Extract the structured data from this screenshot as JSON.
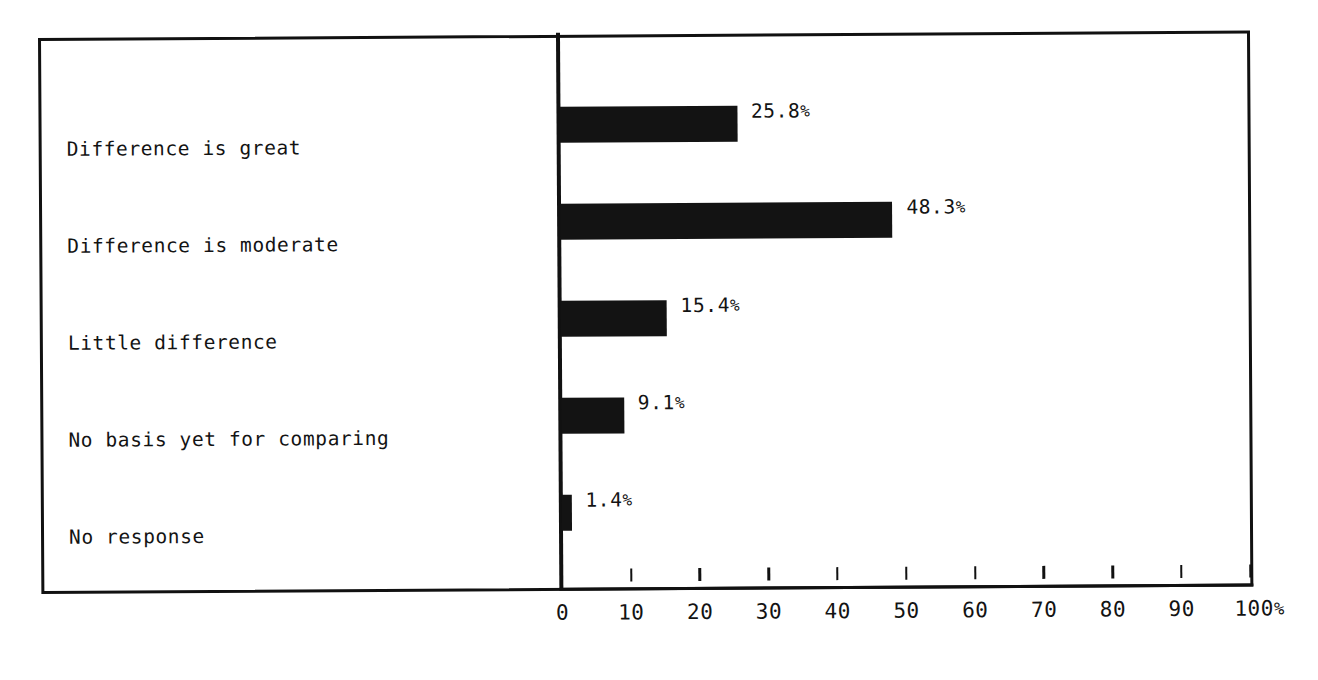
{
  "chart_data": {
    "type": "bar",
    "orientation": "horizontal",
    "title": "",
    "subtitle": "",
    "xlabel": "",
    "ylabel": "",
    "categories": [
      "Difference is great",
      "Difference is moderate",
      "Little difference",
      "No basis yet for comparing",
      "No response"
    ],
    "values": [
      25.8,
      48.3,
      15.4,
      9.1,
      1.4
    ],
    "value_labels": [
      "25.8%",
      "48.3%",
      "15.4%",
      "9.1%",
      "1.4%"
    ],
    "xlim": [
      0,
      100
    ],
    "xticks": [
      0,
      10,
      20,
      30,
      40,
      50,
      60,
      70,
      80,
      90,
      100
    ],
    "xtick_labels": [
      "0",
      "10",
      "20",
      "30",
      "40",
      "50",
      "60",
      "70",
      "80",
      "90",
      "100%"
    ],
    "grid": false,
    "legend": null,
    "bar_color": "#131313",
    "background_color": "#ffffff",
    "frame_color": "#111111"
  },
  "axis": {
    "tick_labels": [
      "0",
      "10",
      "20",
      "30",
      "40",
      "50",
      "60",
      "70",
      "80",
      "90",
      "100%"
    ]
  },
  "rows": [
    {
      "label": "Difference is great",
      "value": 25.8,
      "value_label": "25.8%"
    },
    {
      "label": "Difference is moderate",
      "value": 48.3,
      "value_label": "48.3%"
    },
    {
      "label": "Little difference",
      "value": 15.4,
      "value_label": "15.4%"
    },
    {
      "label": "No basis yet for comparing",
      "value": 9.1,
      "value_label": "9.1%"
    },
    {
      "label": "No response",
      "value": 1.4,
      "value_label": "1.4%"
    }
  ]
}
